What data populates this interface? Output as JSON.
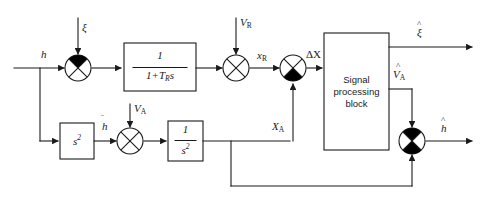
{
  "diagram": {
    "line_color": "#1a1a1a",
    "fill_color": "#000000",
    "background": "#ffffff",
    "inputs": {
      "h": "h",
      "xi": "ξ",
      "VR_main": "V",
      "VR_sub": "R",
      "VA_main": "V",
      "VA_sub": "A"
    },
    "signals": {
      "xR_main": "x",
      "xR_sub": "R",
      "deltaX": "ΔX",
      "XA_main": "X",
      "XA_sub": "A",
      "hddot": "h",
      "hddot_marks": "¨"
    },
    "outputs": {
      "xi_hat": "ξ",
      "xi_hat_mark": "^",
      "VA_hat_main": "V",
      "VA_hat_sub": "A",
      "VA_hat_mark": "^",
      "h_hat": "h",
      "h_hat_mark": "^"
    },
    "blocks": [
      {
        "name": "lag-filter",
        "numerator": "1",
        "denominator_pre": "1+T",
        "denominator_sub": "R",
        "denominator_post": "s"
      },
      {
        "name": "second-derivative",
        "label": "s",
        "exponent": "2"
      },
      {
        "name": "double-integrator",
        "numerator": "1",
        "denominator": "s",
        "denominator_exponent": "2"
      },
      {
        "name": "signal-processing-block",
        "label": "Signal\nprocessing\nblock"
      }
    ],
    "summing_junctions": [
      {
        "name": "sum-h-xi",
        "filled_quadrant": "top"
      },
      {
        "name": "sum-xr-vr",
        "filled_quadrant": "none"
      },
      {
        "name": "sum-deltax",
        "filled_quadrant": "bottom"
      },
      {
        "name": "sum-hddot-va",
        "filled_quadrant": "none"
      },
      {
        "name": "sum-h-hat",
        "filled_quadrant": "top-and-bottom"
      }
    ]
  }
}
